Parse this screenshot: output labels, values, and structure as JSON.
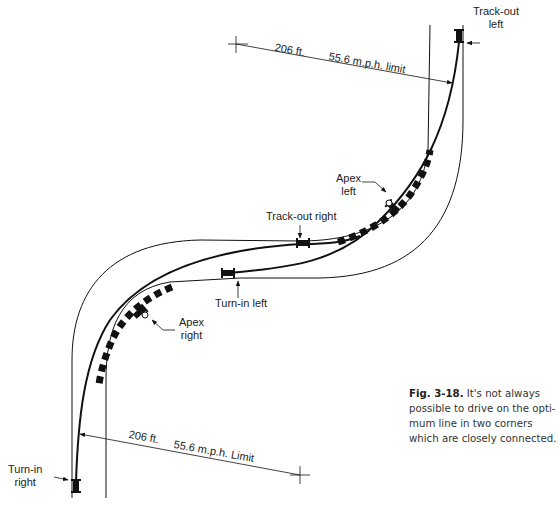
{
  "figure": {
    "number": "Fig. 3-18.",
    "caption_lines": [
      "It's not always",
      "possible to drive on the opti-",
      "mum line in two corners",
      "which are closely connected."
    ]
  },
  "labels": {
    "track_out_left": [
      "Track-out",
      "left"
    ],
    "apex_left": [
      "Apex",
      "left"
    ],
    "track_out_right": "Track-out right",
    "turn_in_left": "Turn-in left",
    "apex_right": [
      "Apex",
      "right"
    ],
    "turn_in_right": [
      "Turn-in",
      "right"
    ]
  },
  "dimensions": {
    "top": {
      "distance": "206 ft.",
      "speed": "55.6 m.p.h. limit"
    },
    "bottom": {
      "distance": "206 ft.",
      "speed": "55.6 m.p.h. Limit"
    }
  },
  "colors": {
    "line": "#111111",
    "background": "#ffffff",
    "text": "#222222"
  }
}
